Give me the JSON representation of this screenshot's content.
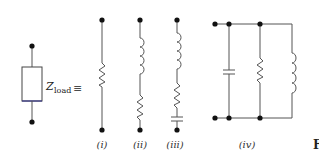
{
  "diagram": {
    "load": {
      "symbol": "Z",
      "subscript": "load",
      "equivalence": "≡"
    },
    "circuits": [
      {
        "label": "(i)",
        "components": [
          "resistor"
        ]
      },
      {
        "label": "(ii)",
        "components": [
          "inductor",
          "resistor"
        ]
      },
      {
        "label": "(iii)",
        "components": [
          "inductor",
          "resistor",
          "capacitor"
        ]
      },
      {
        "label": "(iv)",
        "components": [
          "capacitor",
          "resistor",
          "inductor"
        ],
        "topology": "parallel"
      }
    ],
    "figure_label_fragment": "F"
  },
  "colors": {
    "wire": "#555555",
    "node": "#111111",
    "box_bottom": "#3a3a8a"
  }
}
